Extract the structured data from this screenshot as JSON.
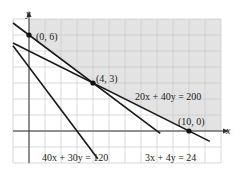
{
  "chart_data": {
    "type": "line",
    "title": "",
    "xlabel": "x",
    "ylabel": "y",
    "xlim": [
      -1,
      12
    ],
    "ylim": [
      -2,
      7
    ],
    "grid": true,
    "colors": {
      "shade": "#e3e3e3",
      "grid": "#c8c8c8",
      "line": "#1a1a1a",
      "axis": "#333333"
    },
    "series": [
      {
        "name": "3x + 4y = 24",
        "a": 3,
        "b": 4,
        "c": 24,
        "x_range": [
          -1,
          8.2
        ]
      },
      {
        "name": "20x + 40y = 200",
        "a": 20,
        "b": 40,
        "c": 200,
        "x_range": [
          -1,
          11.3
        ]
      },
      {
        "name": "40x + 30y = 120",
        "a": 40,
        "b": 30,
        "c": 120,
        "x_range": [
          -1,
          4.3
        ]
      }
    ],
    "shaded_region": {
      "description": "feasible region: 3x+4y>=24, 20x+40y>=200, x>=0, y>=0",
      "vertices": [
        [
          0,
          7
        ],
        [
          0,
          6
        ],
        [
          4,
          3
        ],
        [
          10,
          0
        ],
        [
          12,
          0
        ],
        [
          12,
          7
        ]
      ]
    },
    "points": [
      {
        "label": "(0, 6)",
        "x": 0,
        "y": 6
      },
      {
        "label": "(4, 3)",
        "x": 4,
        "y": 3
      },
      {
        "label": "(10, 0)",
        "x": 10,
        "y": 0
      }
    ],
    "annotations": [
      {
        "text": "20x + 40y = 200",
        "x": 6.6,
        "y": 1.9
      },
      {
        "text": "40x + 30y = 120",
        "x": 0.7,
        "y": -1.6
      },
      {
        "text": "3x + 4y = 24",
        "x": 5.2,
        "y": -1.6
      }
    ]
  },
  "labels": {
    "x_axis": "x",
    "y_axis": "y",
    "p0": "(0, 6)",
    "p1": "(4, 3)",
    "p2": "(10, 0)",
    "eq1": "20x + 40y = 200",
    "eq2": "40x + 30y = 120",
    "eq3": "3x + 4y = 24"
  }
}
